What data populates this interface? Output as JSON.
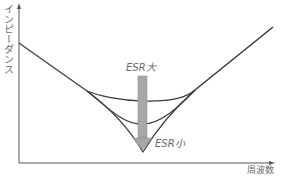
{
  "diagram": {
    "title": "",
    "y_axis_label": "インピーダンス",
    "x_axis_label": "周波数",
    "arrow_top_label": "ESR大",
    "arrow_bottom_label": "ESR小",
    "colors": {
      "curve": "#3a3a3a",
      "axis": "#555555",
      "arrow_fill": "#a8a8a8",
      "text": "#6a6a6a"
    },
    "curves": [
      {
        "name": "ESR大",
        "shape": "shallow-bowl"
      },
      {
        "name": "ESR中",
        "shape": "medium-bowl"
      },
      {
        "name": "ESR小",
        "shape": "sharp-v"
      }
    ]
  }
}
